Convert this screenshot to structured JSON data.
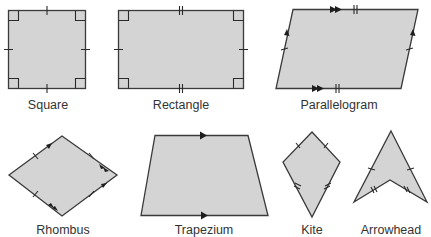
{
  "shapes": [
    {
      "name": "square",
      "label": "Square",
      "fill": "#d4d4d4"
    },
    {
      "name": "rectangle",
      "label": "Rectangle",
      "fill": "#d4d4d4"
    },
    {
      "name": "parallelogram",
      "label": "Parallelogram",
      "fill": "#d4d4d4"
    },
    {
      "name": "rhombus",
      "label": "Rhombus",
      "fill": "#d4d4d4"
    },
    {
      "name": "trapezium",
      "label": "Trapezium",
      "fill": "#d4d4d4"
    },
    {
      "name": "kite",
      "label": "Kite",
      "fill": "#d4d4d4"
    },
    {
      "name": "arrowhead",
      "label": "Arrowhead",
      "fill": "#d4d4d4"
    }
  ],
  "colors": {
    "fill": "#d4d4d4",
    "stroke": "#3a3a3a",
    "text": "#333333"
  }
}
